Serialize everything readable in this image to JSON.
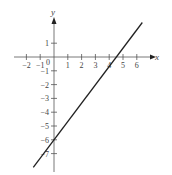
{
  "chart_data": {
    "type": "line",
    "title": "",
    "xlabel": "x",
    "ylabel": "y",
    "x_ticks": [
      -2,
      -1,
      0,
      1,
      2,
      3,
      4,
      5,
      6
    ],
    "y_ticks": [
      1,
      -1,
      -2,
      -3,
      -4,
      -5,
      -6,
      -7
    ],
    "xlim": [
      -2.5,
      7
    ],
    "ylim": [
      -8,
      3
    ],
    "grid": false,
    "series": [
      {
        "name": "line",
        "equation": "y = (4/3)x - 6",
        "x": [
          -1.5,
          6.4
        ],
        "y": [
          -8.0,
          2.5
        ],
        "color": "#222222"
      }
    ],
    "annotations": [
      {
        "type": "point",
        "x": 0,
        "y": -6,
        "note": "y-intercept"
      },
      {
        "type": "point",
        "x": 4.5,
        "y": 0,
        "note": "x-intercept"
      }
    ]
  },
  "labels": {
    "x_axis": "x",
    "y_axis": "y",
    "origin": "0"
  }
}
